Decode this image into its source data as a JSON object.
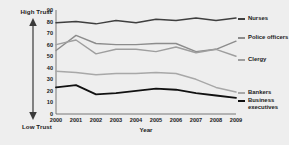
{
  "chart_data": {
    "type": "line",
    "title": "",
    "xlabel": "Year",
    "ylabel": "",
    "x": [
      2000,
      2001,
      2002,
      2003,
      2004,
      2005,
      2006,
      2007,
      2008,
      2009
    ],
    "xlim": [
      2000,
      2009
    ],
    "ylim": [
      0,
      90
    ],
    "yticks": [
      0,
      10,
      20,
      30,
      40,
      50,
      60,
      70,
      80,
      90
    ],
    "xticks": [
      "2000",
      "2001",
      "2002",
      "2003",
      "2004",
      "2005",
      "2006",
      "2007",
      "2008",
      "2009"
    ],
    "grid": false,
    "legend_position": "right",
    "axis_annotations": {
      "high": "High Trust",
      "low": "Low Trust"
    },
    "series": [
      {
        "name": "Nurses",
        "color": "#3f3f3f",
        "width": 1.5,
        "values": [
          79,
          80,
          78,
          81,
          79,
          82,
          81,
          83,
          81,
          83
        ]
      },
      {
        "name": "Police officers",
        "color": "#8c8c8c",
        "width": 1.4,
        "values": [
          55,
          68,
          61,
          60,
          60,
          61,
          61,
          54,
          56,
          63
        ]
      },
      {
        "name": "Clergy",
        "color": "#9e9e9e",
        "width": 1.4,
        "values": [
          60,
          64,
          52,
          56,
          56,
          54,
          58,
          53,
          56,
          50
        ]
      },
      {
        "name": "Bankers",
        "color": "#a8a8a8",
        "width": 1.5,
        "values": [
          37,
          36,
          34,
          35,
          35,
          36,
          35,
          30,
          23,
          19
        ]
      },
      {
        "name": "Business executives",
        "color": "#111111",
        "width": 1.8,
        "values": [
          23,
          25,
          17,
          18,
          20,
          22,
          21,
          18,
          16,
          14
        ]
      }
    ]
  },
  "legend": {
    "items": [
      {
        "label": "Nurses",
        "color": "#3f3f3f"
      },
      {
        "label": "Police officers",
        "color": "#8c8c8c"
      },
      {
        "label": "Clergy",
        "color": "#9e9e9e"
      },
      {
        "label": "Bankers",
        "color": "#a8a8a8"
      },
      {
        "label": "Business executives",
        "color": "#111111"
      }
    ]
  }
}
